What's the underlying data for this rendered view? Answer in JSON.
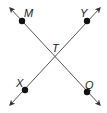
{
  "diagram": {
    "type": "intersecting-lines",
    "colors": {
      "line": "#555555",
      "point": "#111111",
      "label": "#222222"
    },
    "lines": [
      {
        "name": "MQ",
        "from": [
          10,
          8
        ],
        "to": [
          100,
          105
        ]
      },
      {
        "name": "XY",
        "from": [
          10,
          105
        ],
        "to": [
          100,
          8
        ]
      }
    ],
    "points": [
      {
        "label": "M",
        "x": 22,
        "y": 21,
        "lx": 24,
        "ly": 17
      },
      {
        "label": "Y",
        "x": 87,
        "y": 21,
        "lx": 78,
        "ly": 17
      },
      {
        "label": "X",
        "x": 25,
        "y": 90,
        "lx": 16,
        "ly": 87
      },
      {
        "label": "Q",
        "x": 87,
        "y": 92,
        "lx": 85,
        "ly": 88
      }
    ],
    "intersection": {
      "label": "T",
      "x": 55,
      "y": 57,
      "lx": 52,
      "ly": 51
    }
  }
}
